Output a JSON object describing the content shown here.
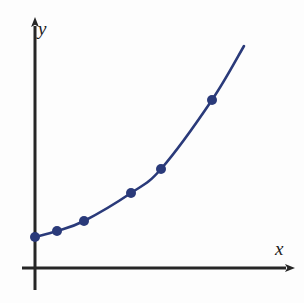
{
  "figure": {
    "background_color": "#fdfdfd",
    "width": 304,
    "height": 303
  },
  "axes": {
    "color": "#262626",
    "line_width": 3,
    "x_axis_label": "x",
    "y_axis_label": "y",
    "origin_px": [
      35,
      268
    ],
    "x_axis": {
      "start_px": [
        22,
        268
      ],
      "end_px": [
        292,
        268
      ],
      "arrow": true
    },
    "y_axis": {
      "start_px": [
        35,
        290
      ],
      "end_px": [
        35,
        20
      ],
      "arrow": true
    }
  },
  "chart_data": {
    "type": "line",
    "title": "",
    "subtitle": "",
    "xlabel": "x",
    "ylabel": "y",
    "grid": false,
    "legend": null,
    "legend_position": "none",
    "axis_arrows": true,
    "tick_labels_x": [],
    "tick_labels_y": [],
    "xlim": [
      0,
      10
    ],
    "ylim": [
      0,
      10
    ],
    "series": [
      {
        "name": "curve",
        "line_color": "#2a3a7a",
        "line_width": 2.6,
        "marker": "circle",
        "marker_color": "#2a3a7a",
        "marker_radius": 5,
        "points_px": [
          [
            35,
            237
          ],
          [
            57,
            231
          ],
          [
            84,
            221
          ],
          [
            131,
            193
          ],
          [
            161,
            169
          ],
          [
            212,
            100
          ]
        ],
        "curve_extension_px": [
          244,
          46
        ],
        "x": [
          0.0,
          1.0,
          2.2,
          4.3,
          5.7,
          8.0
        ],
        "values": [
          1.4,
          1.7,
          2.1,
          3.4,
          4.5,
          7.6
        ]
      }
    ]
  }
}
